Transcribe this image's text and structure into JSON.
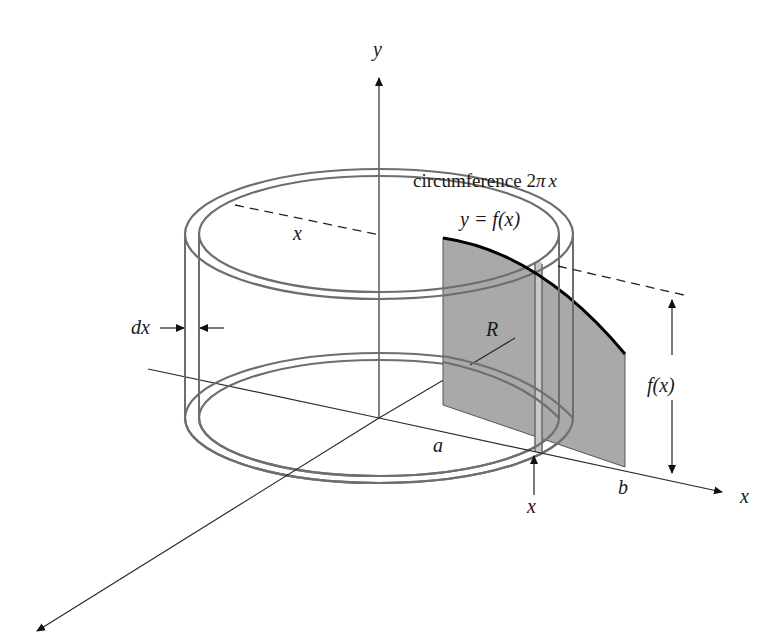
{
  "diagram": {
    "labels": {
      "y_axis": "y",
      "x_axis": "x",
      "circumference": "circumference 2πx",
      "circumference_text": "circumference 2",
      "circumference_pi": "π",
      "circumference_x": "x",
      "curve": "y = f(x)",
      "radius_x": "x",
      "dx": "dx",
      "R": "R",
      "a": "a",
      "b": "b",
      "x_position": "x",
      "height": "f(x)"
    },
    "colors": {
      "region_fill": "#a9a9a9",
      "shell_stroke": "#6e6e6e",
      "axis_stroke": "#2a2a2a",
      "curve_stroke": "#000000",
      "strip_fill": "#c8c8c8"
    }
  }
}
